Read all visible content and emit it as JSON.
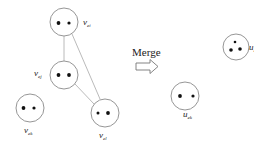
{
  "diagram": {
    "action_label": "Merge",
    "colors": {
      "stroke": "#8a8a8a",
      "edge": "#a8a8a8",
      "dot": "#111111",
      "text": "#222222"
    },
    "left_nodes": [
      {
        "id": "top",
        "label": "v",
        "sub": "ei",
        "dots": 2
      },
      {
        "id": "middle",
        "label": "v",
        "sub": "ej",
        "dots": 2
      },
      {
        "id": "bottom-left",
        "label": "v",
        "sub": "ek",
        "dots": 2
      },
      {
        "id": "bottom-right",
        "label": "v",
        "sub": "el",
        "dots": 2
      }
    ],
    "right_nodes": [
      {
        "id": "merged-top",
        "label": "u",
        "sub": "ei",
        "dots": 3
      },
      {
        "id": "merged-bottom",
        "label": "u",
        "sub": "ek",
        "dots": 2
      }
    ]
  }
}
